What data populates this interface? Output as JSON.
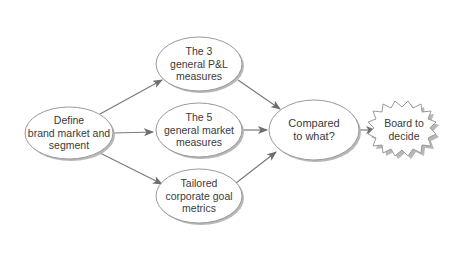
{
  "diagram": {
    "type": "flowchart",
    "colors": {
      "node_fill": "#ffffff",
      "node_stroke": "#9a9a9a",
      "shadow": "#b8b8b8",
      "arrow": "#6e6e6e",
      "text": "#3a3a3a"
    },
    "nodes": [
      {
        "id": "define",
        "shape": "ellipse",
        "lines": [
          "Define",
          "brand market and",
          "segment"
        ]
      },
      {
        "id": "pl",
        "shape": "ellipse",
        "lines": [
          "The 3",
          "general P&L",
          "measures"
        ]
      },
      {
        "id": "market",
        "shape": "ellipse",
        "lines": [
          "The 5",
          "general market",
          "measures"
        ]
      },
      {
        "id": "tailored",
        "shape": "ellipse",
        "lines": [
          "Tailored",
          "corporate goal",
          "metrics"
        ]
      },
      {
        "id": "compared",
        "shape": "ellipse",
        "lines": [
          "Compared",
          "to what?"
        ]
      },
      {
        "id": "board",
        "shape": "starburst",
        "lines": [
          "Board to",
          "decide"
        ]
      }
    ],
    "edges": [
      {
        "from": "define",
        "to": "pl"
      },
      {
        "from": "define",
        "to": "market"
      },
      {
        "from": "define",
        "to": "tailored"
      },
      {
        "from": "pl",
        "to": "compared"
      },
      {
        "from": "market",
        "to": "compared"
      },
      {
        "from": "tailored",
        "to": "compared"
      },
      {
        "from": "compared",
        "to": "board"
      }
    ]
  }
}
